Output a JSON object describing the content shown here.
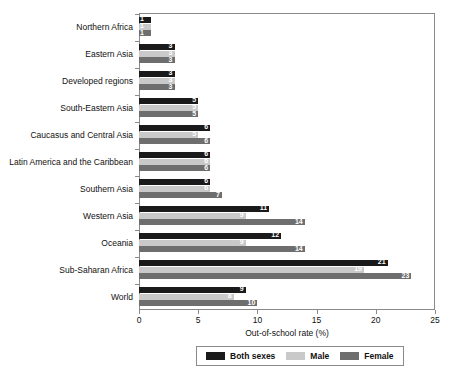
{
  "chart_data": {
    "type": "bar",
    "orientation": "horizontal",
    "title": "",
    "xlabel": "Out-of-school rate (%)",
    "ylabel": "",
    "xlim": [
      0,
      25
    ],
    "xticks": [
      0,
      5,
      10,
      15,
      20,
      25
    ],
    "grid": false,
    "legend_position": "bottom",
    "categories": [
      "Northern Africa",
      "Eastern Asia",
      "Developed regions",
      "South-Eastern Asia",
      "Caucasus and Central Asia",
      "Latin America and the Caribbean",
      "Southern Asia",
      "Western Asia",
      "Oceania",
      "Sub-Saharan Africa",
      "World"
    ],
    "series": [
      {
        "name": "Both sexes",
        "color": "#1a1a1a",
        "values": [
          1,
          3,
          3,
          5,
          6,
          6,
          6,
          11,
          12,
          21,
          9
        ]
      },
      {
        "name": "Male",
        "color": "#c9c9c9",
        "values": [
          1,
          3,
          3,
          5,
          5,
          6,
          6,
          9,
          9,
          19,
          8
        ]
      },
      {
        "name": "Female",
        "color": "#6e6e6e",
        "values": [
          1,
          3,
          3,
          5,
          6,
          6,
          7,
          14,
          14,
          23,
          10
        ]
      }
    ],
    "value_labels": {
      "both_sexes": [
        "1",
        "3",
        "3",
        "5",
        "6",
        "6",
        "6",
        "11",
        "12",
        "21",
        "9"
      ],
      "male": [
        "1",
        "3",
        "3",
        "5",
        "5",
        "6",
        "6",
        "9",
        "9",
        "19",
        "8"
      ],
      "female": [
        "1",
        "3",
        "3",
        "5",
        "6",
        "6",
        "7",
        "14",
        "14",
        "23",
        "10"
      ]
    }
  },
  "axis": {
    "x_title": "Out-of-school rate (%)",
    "tick_labels": [
      "0",
      "5",
      "10",
      "15",
      "20",
      "25"
    ]
  },
  "legend": {
    "items": [
      {
        "label": "Both sexes",
        "color": "#1a1a1a"
      },
      {
        "label": "Male",
        "color": "#c9c9c9"
      },
      {
        "label": "Female",
        "color": "#6e6e6e"
      }
    ]
  }
}
